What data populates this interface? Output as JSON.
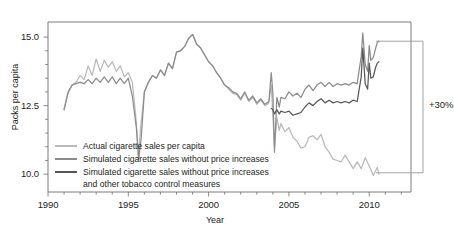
{
  "chart_data": {
    "type": "line",
    "title": "",
    "xlabel": "Year",
    "ylabel": "Packs per capita",
    "xlim": [
      1990,
      2012.6
    ],
    "ylim": [
      9.35,
      15.55
    ],
    "xticks": [
      "1990",
      "1995",
      "2000",
      "2005",
      "2010"
    ],
    "xtick_values": [
      1990,
      1995,
      2000,
      2005,
      2010
    ],
    "yticks": [
      "15.0",
      "12.5",
      "10.0"
    ],
    "ytick_values": [
      15.0,
      12.5,
      10.0
    ],
    "ytick_minor_values": [
      14.5,
      14.0,
      13.5,
      13.0,
      12.0,
      11.5,
      11.0,
      10.5
    ],
    "grid": false,
    "legend_position": "lower-left-inside",
    "annotations": [
      {
        "text": "+30%",
        "kind": "bracket-right",
        "from_value": 14.85,
        "to_value": 10.05
      }
    ],
    "series": [
      {
        "name": "Actual cigarette sales per capita",
        "color": "#b9b9b9",
        "x": [
          1991.0,
          1991.25,
          1991.5,
          1991.75,
          1992.0,
          1992.25,
          1992.5,
          1992.75,
          1993.0,
          1993.25,
          1993.5,
          1993.75,
          1994.0,
          1994.25,
          1994.5,
          1994.75,
          1995.0,
          1995.25,
          1995.5,
          1995.62,
          1995.75,
          1996.0,
          1996.25,
          1996.5,
          1996.75,
          1997.0,
          1997.25,
          1997.5,
          1997.75,
          1998.0,
          1998.25,
          1998.5,
          1998.75,
          1999.0,
          1999.25,
          1999.5,
          1999.75,
          2000.0,
          2000.25,
          2000.5,
          2000.75,
          2001.0,
          2001.25,
          2001.5,
          2001.75,
          2002.0,
          2002.25,
          2002.5,
          2002.75,
          2003.0,
          2003.25,
          2003.5,
          2003.75,
          2003.9,
          2004.0,
          2004.1,
          2004.25,
          2004.4,
          2004.5,
          2004.75,
          2005.0,
          2005.25,
          2005.5,
          2005.75,
          2006.0,
          2006.25,
          2006.5,
          2006.75,
          2007.0,
          2007.25,
          2007.5,
          2007.75,
          2008.0,
          2008.25,
          2008.5,
          2008.75,
          2009.0,
          2009.25,
          2009.5,
          2009.75,
          2010.0,
          2010.25,
          2010.5,
          2010.6
        ],
        "y": [
          12.35,
          12.95,
          13.25,
          13.35,
          13.6,
          13.45,
          13.95,
          13.6,
          14.2,
          13.75,
          14.15,
          13.9,
          14.1,
          13.75,
          13.95,
          13.55,
          13.7,
          13.35,
          11.9,
          10.6,
          11.6,
          13.0,
          13.35,
          13.6,
          13.5,
          13.8,
          13.6,
          14.05,
          13.85,
          14.45,
          14.5,
          14.65,
          14.95,
          15.1,
          14.75,
          14.6,
          14.35,
          14.1,
          13.95,
          13.7,
          13.5,
          13.25,
          13.1,
          12.95,
          12.9,
          12.7,
          12.95,
          12.65,
          12.8,
          12.55,
          12.7,
          12.5,
          12.6,
          13.25,
          12.15,
          11.0,
          12.05,
          11.6,
          11.85,
          11.55,
          11.7,
          11.35,
          11.2,
          10.95,
          11.0,
          11.35,
          11.4,
          11.25,
          11.45,
          11.0,
          10.8,
          10.55,
          10.5,
          10.45,
          10.7,
          10.45,
          10.2,
          10.45,
          10.2,
          10.6,
          10.3,
          9.95,
          10.25,
          10.0
        ]
      },
      {
        "name": "Simulated cigarette sales without price increases",
        "color": "#8c8c8c",
        "x": [
          1991.0,
          1991.25,
          1991.5,
          1991.75,
          1992.0,
          1992.25,
          1992.5,
          1992.75,
          1993.0,
          1993.25,
          1993.5,
          1993.75,
          1994.0,
          1994.25,
          1994.5,
          1994.75,
          1995.0,
          1995.25,
          1995.5,
          1995.65,
          1995.8,
          1996.0,
          1996.25,
          1996.5,
          1996.75,
          1997.0,
          1997.25,
          1997.5,
          1997.75,
          1998.0,
          1998.25,
          1998.5,
          1998.75,
          1999.0,
          1999.25,
          1999.5,
          1999.75,
          2000.0,
          2000.25,
          2000.5,
          2000.75,
          2001.0,
          2001.25,
          2001.5,
          2001.75,
          2002.0,
          2002.25,
          2002.5,
          2002.75,
          2003.0,
          2003.25,
          2003.5,
          2003.75,
          2003.9,
          2004.0,
          2004.1,
          2004.25,
          2004.4,
          2004.5,
          2004.75,
          2005.0,
          2005.25,
          2005.5,
          2005.75,
          2006.0,
          2006.25,
          2006.5,
          2006.75,
          2007.0,
          2007.25,
          2007.5,
          2007.75,
          2008.0,
          2008.25,
          2008.5,
          2008.75,
          2009.0,
          2009.25,
          2009.5,
          2009.6,
          2009.75,
          2009.9,
          2010.0,
          2010.1,
          2010.25,
          2010.4,
          2010.5,
          2010.6
        ],
        "y": [
          12.35,
          13.0,
          13.25,
          13.3,
          13.35,
          13.3,
          13.45,
          13.3,
          13.5,
          13.35,
          13.55,
          13.35,
          13.55,
          13.3,
          13.5,
          13.3,
          13.5,
          12.85,
          11.7,
          10.55,
          11.3,
          13.0,
          13.35,
          13.6,
          13.5,
          13.8,
          13.6,
          14.05,
          13.85,
          14.45,
          14.5,
          14.65,
          14.95,
          15.1,
          14.75,
          14.6,
          14.35,
          14.1,
          13.95,
          13.7,
          13.5,
          13.25,
          13.15,
          13.0,
          12.95,
          12.75,
          13.0,
          12.7,
          12.85,
          12.6,
          12.75,
          12.55,
          12.65,
          13.7,
          12.95,
          10.8,
          12.8,
          12.45,
          12.8,
          12.75,
          13.0,
          12.85,
          12.95,
          12.8,
          13.1,
          13.25,
          13.05,
          13.25,
          13.35,
          13.2,
          13.35,
          13.2,
          13.3,
          13.25,
          13.3,
          13.25,
          13.35,
          13.3,
          14.3,
          15.15,
          14.0,
          13.75,
          14.7,
          14.15,
          14.25,
          14.6,
          14.8,
          14.85
        ]
      },
      {
        "name": "Simulated cigarette sales without price increases and other tobacco control measures",
        "color": "#585858",
        "x": [
          2003.9,
          2004.0,
          2004.1,
          2004.25,
          2004.4,
          2004.5,
          2004.75,
          2005.0,
          2005.25,
          2005.5,
          2005.75,
          2006.0,
          2006.25,
          2006.5,
          2006.75,
          2007.0,
          2007.25,
          2007.5,
          2007.75,
          2008.0,
          2008.25,
          2008.5,
          2008.75,
          2009.0,
          2009.25,
          2009.5,
          2009.6,
          2009.75,
          2009.9,
          2010.0,
          2010.1,
          2010.25,
          2010.4,
          2010.5,
          2010.6
        ],
        "y": [
          12.4,
          12.35,
          12.2,
          12.35,
          12.2,
          12.3,
          12.25,
          12.3,
          12.15,
          12.2,
          12.25,
          12.45,
          12.6,
          12.5,
          12.65,
          12.75,
          12.6,
          12.7,
          12.6,
          12.65,
          12.6,
          12.65,
          12.6,
          12.7,
          12.65,
          13.55,
          14.6,
          13.3,
          13.1,
          14.05,
          13.5,
          13.55,
          13.9,
          14.05,
          14.1
        ]
      }
    ]
  },
  "axis": {
    "ylabel": "Packs per capita",
    "xlabel": "Year",
    "ytick_0": "15.0",
    "ytick_1": "12.5",
    "ytick_2": "10.0",
    "xtick_0": "1990",
    "xtick_1": "1995",
    "xtick_2": "2000",
    "xtick_3": "2005",
    "xtick_4": "2010"
  },
  "legend": {
    "items": [
      {
        "label": "Actual cigarette sales per capita",
        "label2": "",
        "color": "#b9b9b9"
      },
      {
        "label": "Simulated cigarette sales without price increases",
        "label2": "",
        "color": "#8c8c8c"
      },
      {
        "label": "Simulated cigarette sales without price increases",
        "label2": "and other tobacco control measures",
        "color": "#585858"
      }
    ]
  },
  "annotation": {
    "bracket_label": "+30%"
  },
  "colors": {
    "actual": "#b9b9b9",
    "sim_price": "#8c8c8c",
    "sim_price_control": "#585858",
    "axis": "#6d6d6d",
    "text": "#231f20"
  }
}
